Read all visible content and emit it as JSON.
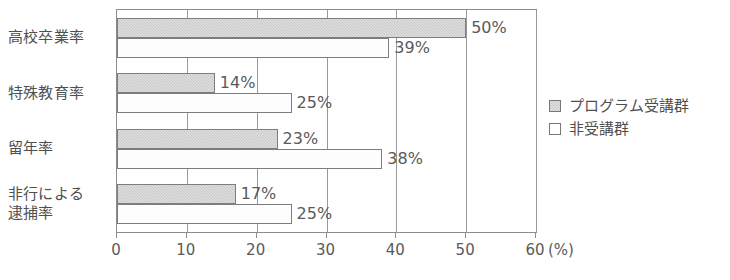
{
  "chart_data": {
    "type": "bar",
    "orientation": "horizontal",
    "title": "",
    "subtitle": "",
    "xlabel": "(%)",
    "ylabel": "",
    "categories": [
      "高校卒業率",
      "特殊教育率",
      "留年率",
      "非行による\n逮捕率"
    ],
    "series": [
      {
        "name": "プログラム受講群",
        "values": [
          50,
          14,
          23,
          17
        ],
        "color": "#c9c9c9"
      },
      {
        "name": "非受講群",
        "values": [
          39,
          25,
          38,
          25
        ],
        "color": "#ffffff"
      }
    ],
    "data_labels": [
      [
        "50%",
        "39%"
      ],
      [
        "14%",
        "25%"
      ],
      [
        "23%",
        "38%"
      ],
      [
        "17%",
        "25%"
      ]
    ],
    "xlim": [
      0,
      60
    ],
    "xticks": [
      0,
      10,
      20,
      30,
      40,
      50,
      60
    ],
    "xtick_labels": [
      "0",
      "10",
      "20",
      "30",
      "40",
      "50",
      "60"
    ],
    "axis_unit_label": "(%)",
    "grid": true,
    "grid_axis": "x",
    "legend_position": "right",
    "legend_entries": [
      "プログラム受講群",
      "非受講群"
    ],
    "value_suffix": "%"
  },
  "colors": {
    "program_fill": "#c9c9c9",
    "control_fill": "#ffffff",
    "bar_stroke": "#7d7d7d",
    "axis": "#8c8c8c",
    "grid": "#9a9a9a",
    "text": "#4f4f4f"
  }
}
